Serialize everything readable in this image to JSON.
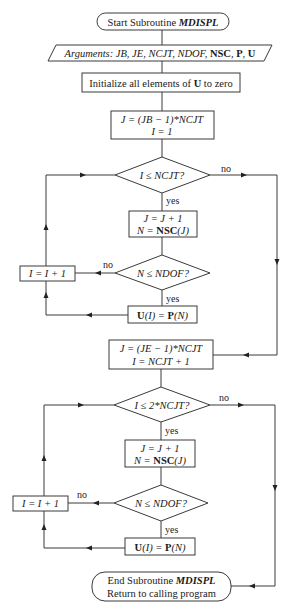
{
  "diagram": {
    "type": "flowchart",
    "title": "Subroutine MDISPL",
    "start": {
      "prefix": "Start Subroutine ",
      "name": "MDISPL"
    },
    "arguments": {
      "label": "Arguments: ",
      "italic_args": "JB, JE, NCJT, NDOF, ",
      "bold_args_1": "NSC",
      "sep_1": ", ",
      "bold_args_2": "P",
      "sep_2": ", ",
      "bold_args_3": "U"
    },
    "initialize": {
      "pre": "Initialize all elements of ",
      "bold": "U",
      "post": " to zero"
    },
    "loop1": {
      "init_line1": "J = (JB − 1)*NCJT",
      "init_line2": "I = 1",
      "condition": "I ≤ NCJT?",
      "assign_line1": "J = J + 1",
      "assign_line2_pre": "N = ",
      "assign_line2_bold": "NSC",
      "assign_line2_post": "(J)",
      "check": "N ≤ NDOF?",
      "increment": "I = I + 1",
      "store_bold1": "U",
      "store_mid": "(I) = ",
      "store_bold2": "P",
      "store_post": "(N)"
    },
    "loop2": {
      "init_line1": "J = (JE − 1)*NCJT",
      "init_line2": "I = NCJT + 1",
      "condition": "I ≤ 2*NCJT?",
      "assign_line1": "J = J + 1",
      "assign_line2_pre": "N = ",
      "assign_line2_bold": "NSC",
      "assign_line2_post": "(J)",
      "check": "N ≤ NDOF?",
      "increment": "I = I + 1",
      "store_bold1": "U",
      "store_mid": "(I) = ",
      "store_bold2": "P",
      "store_post": "(N)"
    },
    "end": {
      "prefix": "End Subroutine ",
      "name": "MDISPL",
      "line2": "Return to calling program"
    },
    "labels": {
      "yes": "yes",
      "no": "no"
    }
  }
}
